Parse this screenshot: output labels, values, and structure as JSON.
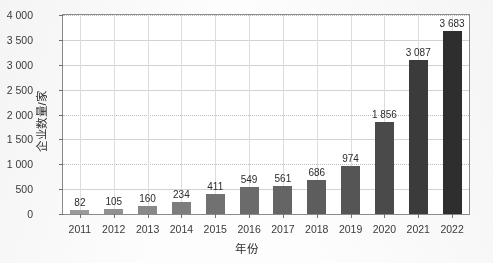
{
  "chart_data": {
    "type": "bar",
    "title": "",
    "xlabel": "年份",
    "ylabel": "企业数量/家",
    "categories": [
      "2011",
      "2012",
      "2013",
      "2014",
      "2015",
      "2016",
      "2017",
      "2018",
      "2019",
      "2020",
      "2021",
      "2022"
    ],
    "values": [
      82,
      105,
      160,
      234,
      411,
      549,
      561,
      686,
      974,
      1856,
      3087,
      3683
    ],
    "value_labels": [
      "82",
      "105",
      "160",
      "234",
      "411",
      "549",
      "561",
      "686",
      "974",
      "1 856",
      "3 087",
      "3 683"
    ],
    "ylim": [
      0,
      4000
    ],
    "ytick_values": [
      0,
      500,
      1000,
      1500,
      2000,
      2500,
      3000,
      3500,
      4000
    ],
    "ytick_labels": [
      "0",
      "500",
      "1 000",
      "1 500",
      "2 000",
      "2 500",
      "3 000",
      "3 500",
      "4 000"
    ],
    "grid": "both",
    "legend": "none",
    "bar_colors": [
      "#9a9a9a",
      "#909090",
      "#888888",
      "#7d7d7d",
      "#717171",
      "#6b6b6b",
      "#656565",
      "#5d5d5d",
      "#555555",
      "#4a4a4a",
      "#3b3b3b",
      "#2e2e2e"
    ]
  }
}
